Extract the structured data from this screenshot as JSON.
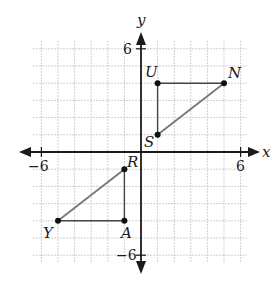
{
  "diagram": {
    "type": "coordinate-plane",
    "axes": {
      "x_label": "x",
      "y_label": "y",
      "x_min_label": "−6",
      "x_max_label": "6",
      "y_min_label": "−6",
      "y_max_label": "6",
      "range": [
        -6,
        6
      ],
      "grid": true
    },
    "triangles": [
      {
        "name": "SUN",
        "vertices": [
          {
            "label": "U",
            "x": 1,
            "y": 4
          },
          {
            "label": "N",
            "x": 5,
            "y": 4
          },
          {
            "label": "S",
            "x": 1,
            "y": 1
          }
        ]
      },
      {
        "name": "RAY",
        "vertices": [
          {
            "label": "R",
            "x": -1,
            "y": -1
          },
          {
            "label": "A",
            "x": -1,
            "y": -4
          },
          {
            "label": "Y",
            "x": -5,
            "y": -4
          }
        ]
      }
    ],
    "colors": {
      "grid": "#c4c4c4",
      "axis": "#1a1a1a",
      "segment": "#777777",
      "point": "#111111"
    }
  }
}
